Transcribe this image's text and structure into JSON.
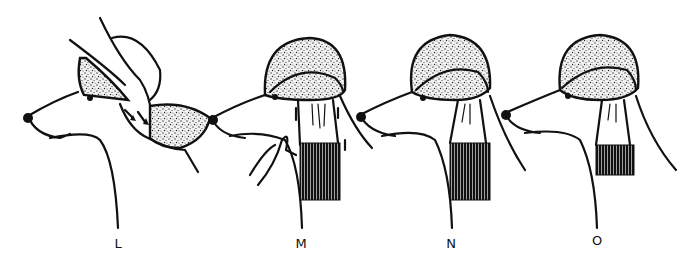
{
  "figure": {
    "panels": [
      {
        "label": "L",
        "label_x": 118,
        "label_y": 236,
        "annotation": "hand pressing topknot fur, arrows showing direction"
      },
      {
        "label": "M",
        "label_x": 301,
        "label_y": 236,
        "annotation": "hand holding ear band, arrows pointing up"
      },
      {
        "label": "N",
        "label_x": 451,
        "label_y": 236,
        "annotation": "finished topknot with long banded ear"
      },
      {
        "label": "O",
        "label_x": 597,
        "label_y": 233,
        "annotation": "finished topknot with short banded ear"
      }
    ],
    "colors": {
      "ink": "#111111",
      "background": "#ffffff"
    }
  }
}
